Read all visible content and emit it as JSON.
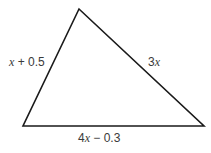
{
  "diagram": {
    "type": "triangle",
    "vertices": {
      "top": [
        79,
        9
      ],
      "bottom_left": [
        23,
        126
      ],
      "bottom_right": [
        204,
        126
      ]
    },
    "stroke_color": "#1a1a1a",
    "text_color": "#3a3a3a",
    "sides": [
      {
        "id": "left",
        "label": "x + 0.5",
        "var": "x",
        "rest": " + 0.5"
      },
      {
        "id": "right",
        "label": "3x",
        "coef": "3",
        "var": "x"
      },
      {
        "id": "bottom",
        "label": "4x − 0.3",
        "coef": "4",
        "var": "x",
        "rest": " − 0.3"
      }
    ]
  }
}
